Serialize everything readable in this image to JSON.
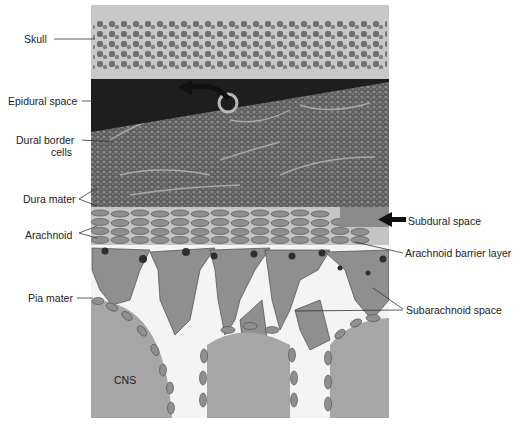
{
  "figure": {
    "labels_left": [
      {
        "id": "skull",
        "text": "Skull",
        "x": 24,
        "y": 33
      },
      {
        "id": "epidural-space",
        "text": "Epidural space",
        "x": 8,
        "y": 95
      },
      {
        "id": "dural-border-cells-1",
        "text": "Dural border",
        "x": 16,
        "y": 134
      },
      {
        "id": "dural-border-cells-2",
        "text": "cells",
        "x": 51,
        "y": 146
      },
      {
        "id": "dura-mater",
        "text": "Dura mater",
        "x": 23,
        "y": 193
      },
      {
        "id": "arachnoid",
        "text": "Arachnoid",
        "x": 25,
        "y": 229
      },
      {
        "id": "pia-mater",
        "text": "Pia mater",
        "x": 28,
        "y": 292
      }
    ],
    "labels_right": [
      {
        "id": "subdural-space",
        "text": "Subdural space",
        "x": 408,
        "y": 215
      },
      {
        "id": "arachnoid-barrier-layer",
        "text": "Arachnoid barrier layer",
        "x": 405,
        "y": 247
      },
      {
        "id": "subarachnoid-space",
        "text": "Subarachnoid space",
        "x": 406,
        "y": 304
      }
    ],
    "inner_labels": [
      {
        "id": "cns",
        "text": "CNS",
        "x": 114,
        "y": 374
      }
    ],
    "colors": {
      "skull_bg": "#c8c8c8",
      "bone_cells": "#6e6e6e",
      "epidural": "#1e1e1e",
      "dura": "#6a6a6a",
      "cell_fill": "#8f8f8f",
      "nucleus": "#3a3a3a",
      "cns": "#a6a6a6",
      "space": "#f4f4f4"
    }
  }
}
